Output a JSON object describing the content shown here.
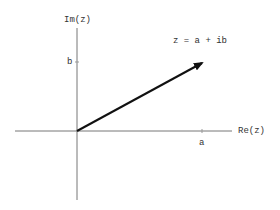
{
  "diagram": {
    "axes": {
      "x_label": "Re(z)",
      "y_label": "Im(z)",
      "x_tick_label": "a",
      "y_tick_label": "b"
    },
    "vector": {
      "label": "z = a + ib",
      "from": "origin",
      "to": "(a, b)"
    },
    "colors": {
      "axis": "#777777",
      "vector": "#111111",
      "text": "#333333",
      "background": "#ffffff"
    }
  }
}
